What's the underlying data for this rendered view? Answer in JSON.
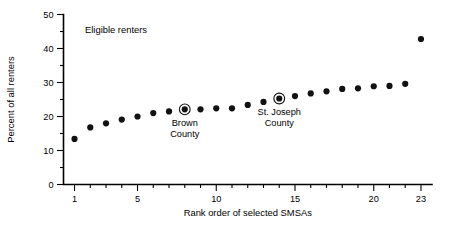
{
  "chart_data": {
    "type": "scatter",
    "title": "",
    "xlabel": "Rank order of selected SMSAs",
    "ylabel": "Percent of all renters",
    "xlim": [
      0.3,
      23.7
    ],
    "ylim": [
      0,
      50
    ],
    "grid": false,
    "legend_position": "none",
    "series_label": "Eligible renters",
    "x": [
      1,
      2,
      3,
      4,
      5,
      6,
      7,
      8,
      9,
      10,
      11,
      12,
      13,
      14,
      15,
      16,
      17,
      18,
      19,
      20,
      21,
      22,
      23
    ],
    "values": [
      13.4,
      16.8,
      18.0,
      19.1,
      20.0,
      21.0,
      21.5,
      22.1,
      22.1,
      22.4,
      22.4,
      23.4,
      24.3,
      25.3,
      26.0,
      26.8,
      27.4,
      28.1,
      28.3,
      28.9,
      29.0,
      29.6,
      42.8
    ],
    "xticks": [
      1,
      5,
      10,
      15,
      20,
      23
    ],
    "xtick_labels": [
      "1",
      "5",
      "10",
      "15",
      "20",
      "23"
    ],
    "xticks_minor": [
      2,
      3,
      4,
      6,
      7,
      8,
      9,
      11,
      12,
      13,
      14,
      16,
      17,
      18,
      19,
      21,
      22
    ],
    "yticks": [
      0,
      10,
      20,
      30,
      40,
      50
    ],
    "ytick_labels": [
      "0",
      "10",
      "20",
      "30",
      "40",
      "50"
    ],
    "yticks_minor": [
      5,
      15,
      25,
      35,
      45
    ],
    "annotations": [
      {
        "label_line1": "Brown",
        "label_line2": "County",
        "x": 8,
        "y": 22.1,
        "highlight": true
      },
      {
        "label_line1": "St. Joseph",
        "label_line2": "County",
        "x": 14,
        "y": 25.3,
        "highlight": true
      }
    ],
    "colors": {
      "point": "#111111",
      "axis": "#000000",
      "background": "#ffffff"
    }
  }
}
